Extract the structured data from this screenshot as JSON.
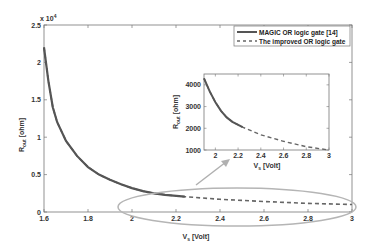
{
  "chart_data": {
    "type": "line",
    "title": "",
    "xlabel": "V_s [Volt]",
    "ylabel": "R_out [ohm]",
    "y_multiplier_label": "x 10^4",
    "xlim": [
      1.6,
      3.0
    ],
    "ylim": [
      0,
      25000
    ],
    "x_ticks": [
      "1.6",
      "1.8",
      "2",
      "2.2",
      "2.4",
      "2.6",
      "2.8",
      "3"
    ],
    "y_ticks": [
      "0",
      "0.5",
      "1",
      "1.5",
      "2",
      "2.5"
    ],
    "grid": false,
    "legend_position": "upper right",
    "series": [
      {
        "name": "MAGIC OR logic gate [14]",
        "style": "solid",
        "color": "#555555",
        "x": [
          1.6,
          1.62,
          1.64,
          1.66,
          1.7,
          1.75,
          1.8,
          1.85,
          1.9,
          1.95,
          2.0,
          2.05,
          2.1,
          2.15,
          2.24
        ],
        "y": [
          22000,
          17500,
          14000,
          12000,
          9500,
          7500,
          6000,
          5000,
          4300,
          3700,
          3200,
          2800,
          2500,
          2300,
          2050
        ]
      },
      {
        "name": "The improved OR logic gate",
        "style": "dashed",
        "color": "#666666",
        "x": [
          1.6,
          1.62,
          1.64,
          1.66,
          1.7,
          1.75,
          1.8,
          1.85,
          1.9,
          1.95,
          2.0,
          2.05,
          2.1,
          2.15,
          2.24,
          2.4,
          2.6,
          2.8,
          3.0
        ],
        "y": [
          22000,
          17500,
          14000,
          12000,
          9500,
          7500,
          6000,
          5000,
          4300,
          3700,
          3200,
          2800,
          2500,
          2300,
          2050,
          1700,
          1400,
          1150,
          1000
        ]
      }
    ],
    "inset": {
      "xlabel": "V_s [Volt]",
      "ylabel": "R_out [ohm]",
      "xlim": [
        1.9,
        3.0
      ],
      "ylim": [
        1000,
        4500
      ],
      "x_ticks": [
        "2",
        "2.2",
        "2.4",
        "2.6",
        "2.8",
        "3"
      ],
      "y_ticks": [
        "1000",
        "2000",
        "3000",
        "4000"
      ]
    },
    "annotations": [
      "ellipse highlighting region V_s 2.0–3.0 near R≈1000–2000",
      "arrow pointing from ellipse to inset zoom"
    ]
  },
  "legend": {
    "items": [
      {
        "label": "MAGIC OR logic gate [14]",
        "style": "solid"
      },
      {
        "label": "The improved OR logic gate",
        "style": "dashed"
      }
    ]
  },
  "axes": {
    "xlabel_main": "V",
    "xlabel_sub": "s",
    "xlabel_unit": " [Volt]",
    "ylabel_main": "R",
    "ylabel_sub": "out",
    "ylabel_unit": " [ohm]",
    "multiplier": "x 10",
    "multiplier_exp": "4"
  }
}
